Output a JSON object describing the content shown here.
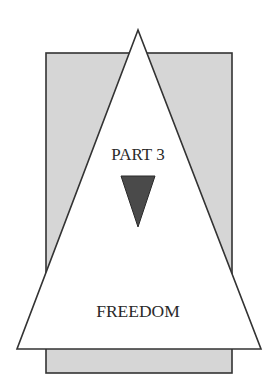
{
  "diagram": {
    "top_label": "PART 3",
    "bottom_label": "FREEDOM",
    "colors": {
      "background": "#ffffff",
      "rectangle_fill": "#d6d6d6",
      "stroke": "#333333",
      "triangle_fill": "#ffffff",
      "inner_triangle_fill": "#4a4a4a",
      "text": "#2a2a2a"
    },
    "shapes": {
      "rectangle": {
        "x": 46,
        "y": 53,
        "width": 186,
        "height": 320
      },
      "large_triangle": {
        "apex": [
          138,
          30
        ],
        "base_left": [
          17,
          349
        ],
        "base_right": [
          261,
          349
        ]
      },
      "inverted_triangle": {
        "top_left": [
          121,
          176
        ],
        "top_right": [
          155,
          176
        ],
        "apex": [
          138,
          227
        ]
      }
    }
  }
}
